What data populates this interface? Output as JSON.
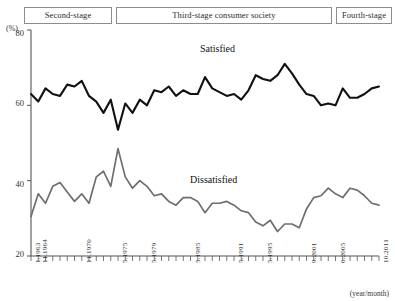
{
  "stages": [
    {
      "label": "Second-stage",
      "flex": 88
    },
    {
      "label": "Third-stage consumer society",
      "flex": 212
    },
    {
      "label": "Fourth-stage",
      "flex": 56
    }
  ],
  "annotations": {
    "satisfied": "Satisfied",
    "dissatisfied": "Dissatisfied"
  },
  "axis": {
    "y_unit": "(%)",
    "x_unit": "(year/month)",
    "y_ticks": [
      "80",
      "60",
      "40",
      "20"
    ]
  },
  "colors": {
    "satisfied_line": "#111111",
    "dissatisfied_line": "#6e6e6e",
    "axis": "#555555",
    "stage_border": "#8d8d8d",
    "background": "#ffffff"
  },
  "chart_data": {
    "type": "line",
    "title": "",
    "subtitle": "",
    "xlabel": "(year/month)",
    "ylabel": "(%)",
    "ylim": [
      20,
      80
    ],
    "grid": false,
    "legend": "inline-annotation",
    "x_tick_labels": [
      "1.1963",
      "11.1964",
      "11.1970",
      "5.1975",
      "5.1979",
      "5.1985",
      "5.1991",
      "5.1995",
      "9.2001",
      "6.2005",
      "10.2011"
    ],
    "x_tick_indices": [
      0,
      1,
      7,
      12,
      16,
      22,
      28,
      32,
      38,
      42,
      48
    ],
    "n_points": 49,
    "series": [
      {
        "name": "Satisfied",
        "color": "#111111",
        "values": [
          63.0,
          61.0,
          64.5,
          63.0,
          62.5,
          65.5,
          65.0,
          66.5,
          62.5,
          61.0,
          58.0,
          61.5,
          53.5,
          60.5,
          58.0,
          61.5,
          60.0,
          64.0,
          63.5,
          65.0,
          62.5,
          64.0,
          63.0,
          63.0,
          67.5,
          64.5,
          63.5,
          62.5,
          63.0,
          61.5,
          64.0,
          68.0,
          67.0,
          66.5,
          68.0,
          71.0,
          68.5,
          65.5,
          63.0,
          62.5,
          60.0,
          60.5,
          60.0,
          64.5,
          62.0,
          62.0,
          63.0,
          64.5,
          65.0
        ]
      },
      {
        "name": "Dissatisfied",
        "color": "#6e6e6e",
        "values": [
          30.5,
          36.5,
          34.0,
          38.5,
          39.5,
          37.0,
          34.5,
          36.5,
          34.0,
          41.0,
          42.5,
          38.5,
          48.5,
          41.0,
          38.0,
          40.0,
          38.5,
          36.0,
          36.5,
          34.5,
          33.5,
          35.5,
          35.5,
          34.5,
          31.5,
          34.0,
          34.0,
          34.5,
          33.5,
          32.0,
          31.5,
          29.0,
          28.0,
          29.5,
          26.5,
          28.5,
          28.5,
          27.5,
          32.5,
          35.5,
          36.0,
          38.0,
          36.5,
          35.5,
          38.0,
          37.5,
          36.0,
          34.0,
          33.5
        ]
      }
    ]
  }
}
